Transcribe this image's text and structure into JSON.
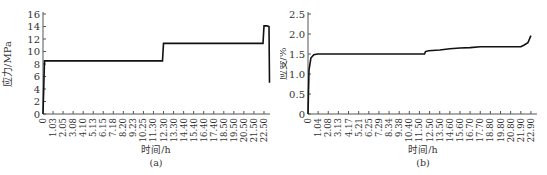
{
  "chart_data": [
    {
      "type": "line",
      "panel": "(a)",
      "title": "",
      "xlabel": "时间/h",
      "ylabel": "应力/MPa",
      "caption": "(a)",
      "ylim": [
        0,
        16
      ],
      "yticks": [
        "0",
        "2",
        "4",
        "6",
        "8",
        "10",
        "12",
        "14",
        "16"
      ],
      "xtick_labels": [
        "0",
        "1.03",
        "2.05",
        "3.08",
        "4.10",
        "5.13",
        "6.15",
        "7.18",
        "8.20",
        "9.23",
        "10.25",
        "11.30",
        "12.30",
        "13.30",
        "14.40",
        "15.40",
        "16.40",
        "17.40",
        "18.50",
        "19.50",
        "20.50",
        "21.50",
        "22.50"
      ],
      "grid": false,
      "series": [
        {
          "name": "stress",
          "x": [
            0,
            0.15,
            0.3,
            12.2,
            12.3,
            22.4,
            22.5,
            22.8,
            23.0,
            23.05
          ],
          "y": [
            0,
            8.5,
            8.5,
            8.5,
            11.3,
            11.3,
            14.1,
            14.1,
            14.0,
            5.0
          ]
        }
      ]
    },
    {
      "type": "line",
      "panel": "(b)",
      "title": "",
      "xlabel": "时间/h",
      "ylabel": "应变/%",
      "caption": "(b)",
      "ylim": [
        0,
        2.5
      ],
      "yticks": [
        "0",
        "0.5",
        "1.0",
        "1.5",
        "2.0",
        "2.5"
      ],
      "xtick_labels": [
        "0",
        "1.04",
        "2.08",
        "3.13",
        "4.17",
        "5.21",
        "6.25",
        "7.29",
        "8.34",
        "9.38",
        "10.40",
        "11.50",
        "12.50",
        "13.50",
        "14.60",
        "15.60",
        "16.70",
        "17.70",
        "18.80",
        "19.80",
        "20.80",
        "21.90",
        "22.90"
      ],
      "grid": false,
      "series": [
        {
          "name": "strain",
          "x": [
            0,
            0.1,
            0.3,
            0.6,
            1.0,
            6.0,
            12.0,
            12.1,
            12.4,
            13.5,
            14.6,
            15.6,
            16.7,
            17.7,
            18.8,
            19.8,
            20.8,
            21.9,
            22.2,
            22.6,
            22.9
          ],
          "y": [
            0,
            1.1,
            1.4,
            1.48,
            1.5,
            1.5,
            1.5,
            1.56,
            1.58,
            1.6,
            1.63,
            1.65,
            1.66,
            1.68,
            1.68,
            1.68,
            1.68,
            1.68,
            1.72,
            1.78,
            1.96
          ]
        }
      ]
    }
  ]
}
